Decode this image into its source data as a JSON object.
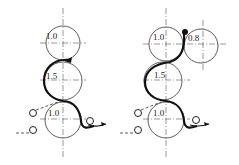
{
  "diagrams": [
    {
      "name": "three-roll-arrangement",
      "rolls": [
        {
          "label": "1.0",
          "position": "top"
        },
        {
          "label": "1.5",
          "position": "middle"
        },
        {
          "label": "1.0",
          "position": "bottom"
        }
      ]
    },
    {
      "name": "four-roll-arrangement",
      "rolls": [
        {
          "label": "1.0",
          "position": "top"
        },
        {
          "label": "0.8",
          "position": "top-right"
        },
        {
          "label": "1.5",
          "position": "middle"
        },
        {
          "label": "1.0",
          "position": "bottom"
        }
      ]
    }
  ],
  "colors": {
    "line": "#333333",
    "web": "#111111",
    "background": "#ffffff"
  }
}
